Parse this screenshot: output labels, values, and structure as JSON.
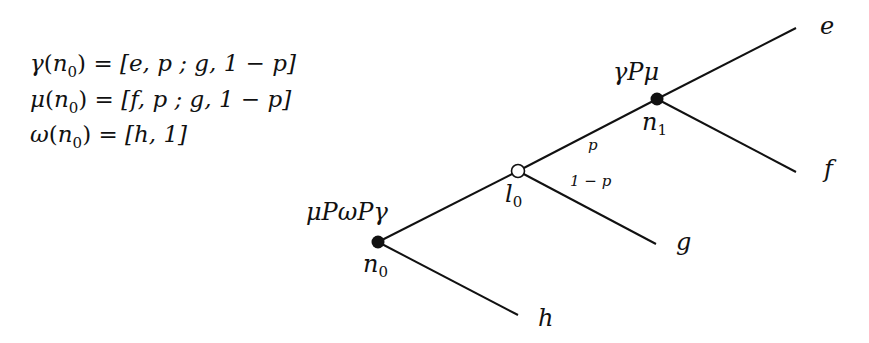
{
  "formulas": [
    {
      "id": "gamma",
      "fn": "γ",
      "arg": "n",
      "arg_sub": "0",
      "value": "[e, p ; g, 1 − p]"
    },
    {
      "id": "mu",
      "fn": "μ",
      "arg": "n",
      "arg_sub": "0",
      "value": "[f, p ; g, 1 − p]"
    },
    {
      "id": "omega",
      "fn": "ω",
      "arg": "n",
      "arg_sub": "0",
      "value": "[h, 1]"
    }
  ],
  "nodes": {
    "n0": {
      "name": "n",
      "sub": "0",
      "type": "decision",
      "label_above": "μPωPγ"
    },
    "l0": {
      "name": "l",
      "sub": "0",
      "type": "chance"
    },
    "n1": {
      "name": "n",
      "sub": "1",
      "type": "decision",
      "label_above": "γPμ"
    }
  },
  "edges": {
    "l0_to_n1_prob": "p",
    "l0_to_g_prob": "1 − p"
  },
  "leaves": {
    "e": "e",
    "f": "f",
    "g": "g",
    "h": "h"
  },
  "colors": {
    "ink": "#111111",
    "background": "#ffffff"
  }
}
